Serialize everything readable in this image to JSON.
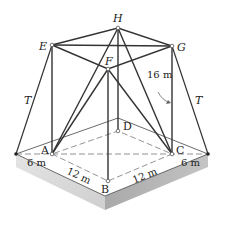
{
  "figure": {
    "type": "space-truss-tower",
    "nodes": {
      "H": {
        "label": "H",
        "x": 118,
        "y": 28
      },
      "E": {
        "label": "E",
        "x": 52,
        "y": 45
      },
      "G": {
        "label": "G",
        "x": 172,
        "y": 46
      },
      "F": {
        "label": "F",
        "x": 108,
        "y": 69
      },
      "A": {
        "label": "A",
        "x": 52,
        "y": 154
      },
      "B": {
        "label": "B",
        "x": 108,
        "y": 181
      },
      "C": {
        "label": "C",
        "x": 172,
        "y": 154
      },
      "D": {
        "label": "D",
        "x": 118,
        "y": 131
      }
    },
    "cables": {
      "left_label": "T",
      "right_label": "T"
    },
    "dimensions": {
      "height": "16 m",
      "left_offset": "6 m",
      "right_offset": "6 m",
      "AB": "12 m",
      "BC": "12 m"
    },
    "colors": {
      "line": "#333333",
      "platform_top": "#ffffff",
      "platform_side_left": "#d8d8d8",
      "platform_side_right": "#b8b8b8"
    }
  }
}
